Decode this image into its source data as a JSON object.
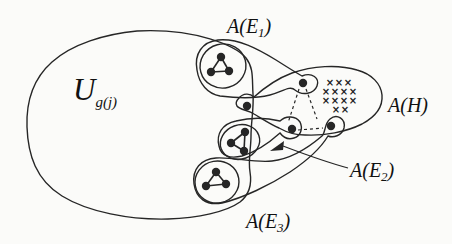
{
  "figure": {
    "title_hint": "hypergraph replacement diagram",
    "ink_color": "#262626",
    "background_color": "#fbfbf9",
    "labels": {
      "universe": {
        "main": "U",
        "sub": "g(j)"
      },
      "e1": {
        "pre": "A(E",
        "sub": "1",
        "post": ")"
      },
      "e2": {
        "pre": "A(E",
        "sub": "2",
        "post": ")"
      },
      "e3": {
        "pre": "A(E",
        "sub": "3",
        "post": ")"
      },
      "h": {
        "text": "A(H)"
      }
    },
    "x_mark_symbol": "×",
    "x_marks": [
      [
        330,
        82
      ],
      [
        339,
        82
      ],
      [
        348,
        82
      ],
      [
        326,
        91
      ],
      [
        335,
        91
      ],
      [
        344,
        91
      ],
      [
        353,
        91
      ],
      [
        326,
        100
      ],
      [
        335,
        100
      ],
      [
        344,
        100
      ],
      [
        353,
        100
      ],
      [
        336,
        109
      ],
      [
        345,
        109
      ]
    ],
    "attachment_dots": {
      "single": [
        247,
        106
      ],
      "e1": [
        303,
        83
      ],
      "e2": [
        292,
        129
      ],
      "e3": [
        331,
        126
      ]
    },
    "triangles": [
      {
        "points": [
          [
            221,
            57
          ],
          [
            211,
            72
          ],
          [
            229,
            71
          ]
        ]
      },
      {
        "points": [
          [
            245,
            132
          ],
          [
            231,
            143
          ],
          [
            244,
            151
          ]
        ]
      },
      {
        "points": [
          [
            216,
            172
          ],
          [
            206,
            186
          ],
          [
            226,
            184
          ]
        ]
      }
    ],
    "dashed_edges": [
      [
        299,
        89,
        288,
        123
      ],
      [
        306,
        89,
        317,
        119
      ],
      [
        298,
        130,
        323,
        128
      ]
    ],
    "dot_radius": 4.2
  }
}
